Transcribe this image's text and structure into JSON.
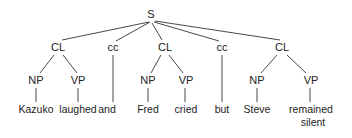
{
  "diagram": {
    "type": "syntax-tree",
    "root": "S",
    "nodes": [
      {
        "id": "s",
        "label": "S",
        "x": 151,
        "y": 18
      },
      {
        "id": "cl1",
        "label": "CL",
        "x": 58,
        "y": 51
      },
      {
        "id": "cc1",
        "label": "cc",
        "x": 113,
        "y": 51
      },
      {
        "id": "cl2",
        "label": "CL",
        "x": 165,
        "y": 51
      },
      {
        "id": "cc2",
        "label": "cc",
        "x": 222,
        "y": 51
      },
      {
        "id": "cl3",
        "label": "CL",
        "x": 282,
        "y": 51
      },
      {
        "id": "np1",
        "label": "NP",
        "x": 36,
        "y": 84
      },
      {
        "id": "vp1",
        "label": "VP",
        "x": 78,
        "y": 84
      },
      {
        "id": "np2",
        "label": "NP",
        "x": 148,
        "y": 84
      },
      {
        "id": "vp2",
        "label": "VP",
        "x": 186,
        "y": 84
      },
      {
        "id": "np3",
        "label": "NP",
        "x": 257,
        "y": 84
      },
      {
        "id": "vp3",
        "label": "VP",
        "x": 311,
        "y": 84
      }
    ],
    "leaves": [
      {
        "id": "w1",
        "label": "Kazuko",
        "x": 36,
        "y": 113
      },
      {
        "id": "w2",
        "label": "laughed",
        "x": 78,
        "y": 113
      },
      {
        "id": "w3",
        "label": "and",
        "x": 107,
        "y": 113
      },
      {
        "id": "w4",
        "label": "Fred",
        "x": 148,
        "y": 113
      },
      {
        "id": "w5",
        "label": "cried",
        "x": 186,
        "y": 113
      },
      {
        "id": "w6",
        "label": "but",
        "x": 222,
        "y": 113
      },
      {
        "id": "w7",
        "label": "Steve",
        "x": 257,
        "y": 113
      },
      {
        "id": "w8",
        "label": "remained",
        "x": 311,
        "y": 113
      },
      {
        "id": "w9",
        "label": "silent",
        "x": 313,
        "y": 126
      }
    ],
    "edges": [
      {
        "from": "S",
        "to": "CL (1)",
        "x1": 149,
        "y1": 22,
        "x2": 62,
        "y2": 40
      },
      {
        "from": "S",
        "to": "cc (1)",
        "x1": 150,
        "y1": 22,
        "x2": 116,
        "y2": 41
      },
      {
        "from": "S",
        "to": "CL (2)",
        "x1": 152,
        "y1": 23,
        "x2": 162,
        "y2": 40
      },
      {
        "from": "S",
        "to": "cc (2)",
        "x1": 154,
        "y1": 22,
        "x2": 219,
        "y2": 41
      },
      {
        "from": "S",
        "to": "CL (3)",
        "x1": 155,
        "y1": 21,
        "x2": 280,
        "y2": 40
      },
      {
        "from": "CL (1)",
        "to": "NP",
        "x1": 54,
        "y1": 55,
        "x2": 40,
        "y2": 73
      },
      {
        "from": "CL (1)",
        "to": "VP",
        "x1": 63,
        "y1": 55,
        "x2": 77,
        "y2": 73
      },
      {
        "from": "CL (2)",
        "to": "NP",
        "x1": 161,
        "y1": 55,
        "x2": 151,
        "y2": 73
      },
      {
        "from": "CL (2)",
        "to": "VP",
        "x1": 169,
        "y1": 55,
        "x2": 183,
        "y2": 73
      },
      {
        "from": "CL (3)",
        "to": "NP",
        "x1": 277,
        "y1": 55,
        "x2": 261,
        "y2": 73
      },
      {
        "from": "CL (3)",
        "to": "VP",
        "x1": 287,
        "y1": 55,
        "x2": 306,
        "y2": 73
      },
      {
        "from": "NP (1)",
        "to": "Kazuko",
        "x1": 36,
        "y1": 88,
        "x2": 36,
        "y2": 102
      },
      {
        "from": "VP (1)",
        "to": "laughed",
        "x1": 78,
        "y1": 88,
        "x2": 78,
        "y2": 102
      },
      {
        "from": "cc (1)",
        "to": "and",
        "x1": 113,
        "y1": 55,
        "x2": 113,
        "y2": 102
      },
      {
        "from": "NP (2)",
        "to": "Fred",
        "x1": 148,
        "y1": 88,
        "x2": 148,
        "y2": 102
      },
      {
        "from": "VP (2)",
        "to": "cried",
        "x1": 185,
        "y1": 88,
        "x2": 185,
        "y2": 102
      },
      {
        "from": "cc (2)",
        "to": "but",
        "x1": 222,
        "y1": 55,
        "x2": 222,
        "y2": 102
      },
      {
        "from": "NP (3)",
        "to": "Steve",
        "x1": 257,
        "y1": 88,
        "x2": 257,
        "y2": 102
      },
      {
        "from": "VP (3)",
        "to": "remained silent",
        "x1": 310,
        "y1": 88,
        "x2": 310,
        "y2": 102
      }
    ],
    "colors": {
      "text": "#222222",
      "line": "#333333",
      "background": "#ffffff"
    }
  }
}
